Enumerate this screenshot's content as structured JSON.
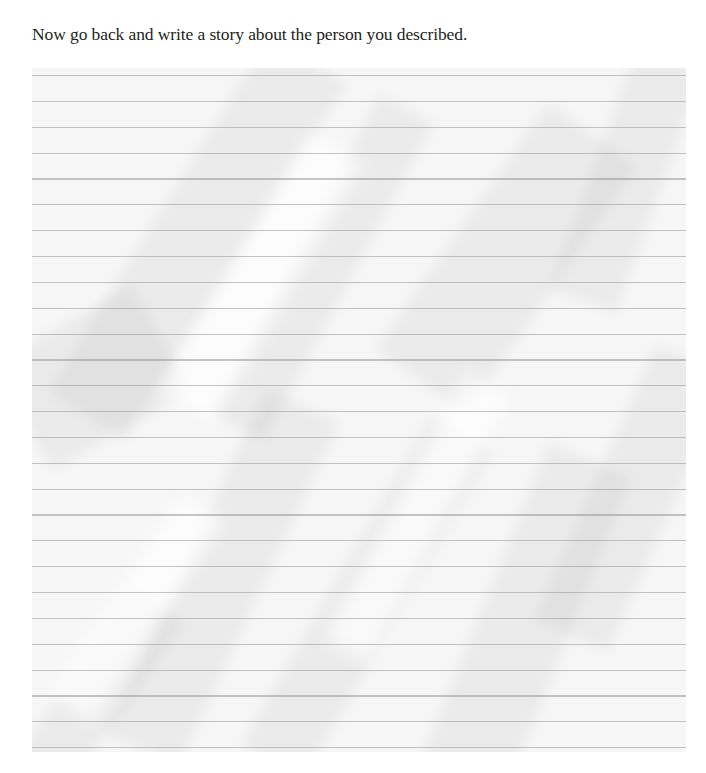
{
  "page": {
    "prompt": "Now go back and write a story about the person you described.",
    "background_color": "#ffffff",
    "text_color": "#231f20"
  },
  "paper": {
    "style": "crumpled lined notebook paper",
    "line_count": 27,
    "paper_color": "#f6f6f6",
    "line_color": "#969696",
    "content": ""
  }
}
